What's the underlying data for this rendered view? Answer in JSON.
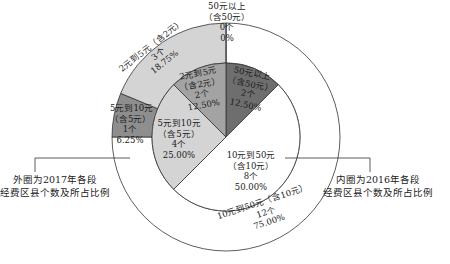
{
  "chart_data": {
    "type": "pie",
    "subtype": "nested-donut",
    "title": "",
    "inner_ring": {
      "description": "内圈为2016年各段经费区县个数及所占比例",
      "categories": [
        "50元以上（含50元）",
        "10元到50元（含10元）",
        "5元到10元（含5元）",
        "2元到5元（含2元）"
      ],
      "counts": [
        2,
        8,
        4,
        2
      ],
      "percentages": [
        12.5,
        50.0,
        25.0,
        12.5
      ],
      "colors": [
        "#6e6e6e",
        "#ffffff",
        "#d4d4d4",
        "#a3a3a3"
      ]
    },
    "outer_ring": {
      "description": "外圈为2017年各段经费区县个数及所占比例",
      "categories": [
        "50元以上（含50元）",
        "10元到50元（含10元）",
        "5元到10元（含5元）",
        "2元到5元（含2元）"
      ],
      "counts": [
        0,
        12,
        1,
        3
      ],
      "percentages": [
        0,
        75.0,
        6.25,
        18.75
      ],
      "colors": [
        "#6e6e6e",
        "#ffffff",
        "#8e8e8e",
        "#d4d4d4"
      ]
    }
  },
  "labels": {
    "outer_50": {
      "line1": "50元以上",
      "line2": "（含50元）",
      "count": "0个",
      "pct": "0%"
    },
    "outer_2_5": {
      "line1": "2元到5元（含2元）",
      "count": "3个",
      "pct": "18.75%"
    },
    "outer_5_10": {
      "line1": "5元到10元",
      "line2": "（含5元）",
      "count": "1个",
      "pct": "6.25%"
    },
    "outer_10_50": {
      "line1": "10元到50元（含10元）",
      "count": "12个",
      "pct": "75.00%"
    },
    "inner_50": {
      "line1": "50元以上",
      "line2": "（含50元）",
      "count": "2个",
      "pct": "12.50%"
    },
    "inner_2_5": {
      "line1": "2元到5元",
      "line2": "（含2元）",
      "count": "2个",
      "pct": "12.50%"
    },
    "inner_5_10": {
      "line1": "5元到10元",
      "line2": "（含5元）",
      "count": "4个",
      "pct": "25.00%"
    },
    "inner_10_50": {
      "line1": "10元到50元",
      "line2": "（含10元）",
      "count": "8个",
      "pct": "50.00%"
    }
  },
  "legend": {
    "outer": {
      "line1": "外圈为2017年各段",
      "line2": "经费区县个数及所占比例"
    },
    "inner": {
      "line1": "内圈为2016年各段",
      "line2": "经费区县个数及所占比例"
    }
  }
}
